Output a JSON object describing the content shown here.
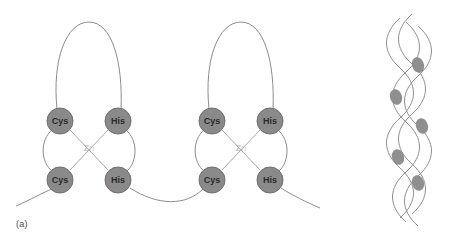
{
  "figure": {
    "panels": [
      {
        "id": "a",
        "label": "(a)",
        "fingers": [
          {
            "metal_label": "Zn",
            "residues": [
              {
                "label": "Cys",
                "position": "top-left",
                "cx": 60,
                "cy": 121
              },
              {
                "label": "His",
                "position": "top-right",
                "cx": 118,
                "cy": 121
              },
              {
                "label": "Cys",
                "position": "bottom-left",
                "cx": 60,
                "cy": 180
              },
              {
                "label": "His",
                "position": "bottom-right",
                "cx": 118,
                "cy": 180
              }
            ],
            "metal_x": 89,
            "metal_y": 148
          },
          {
            "metal_label": "Zn",
            "residues": [
              {
                "label": "Cys",
                "position": "top-left",
                "cx": 212,
                "cy": 121
              },
              {
                "label": "His",
                "position": "top-right",
                "cx": 270,
                "cy": 121
              },
              {
                "label": "Cys",
                "position": "bottom-left",
                "cx": 212,
                "cy": 180
              },
              {
                "label": "His",
                "position": "bottom-right",
                "cx": 270,
                "cy": 180
              }
            ],
            "metal_x": 241,
            "metal_y": 148
          }
        ]
      },
      {
        "id": "b",
        "label": "(b)",
        "bound_domain_count": 4,
        "helix_strand_count": 2
      }
    ],
    "colors": {
      "background": "#ffffff",
      "residue_fill": "#8a8a8a",
      "residue_stroke": "#6f6f6f",
      "residue_text": "#2b2b2b",
      "backbone_stroke": "#8c8c8c",
      "coordination_stroke": "#a8a8a8",
      "metal_text": "#c3c3c3",
      "helix_stroke": "#8e8e8e",
      "domain_fill": "#8f8f8f",
      "label_text": "#4a4a4a"
    },
    "radii": {
      "residue": 13,
      "domain_blob": 6
    }
  }
}
